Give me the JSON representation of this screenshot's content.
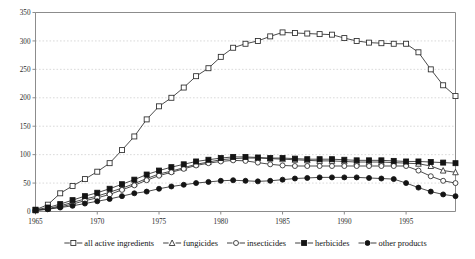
{
  "chart_data": {
    "type": "line",
    "title": "",
    "subtitle": "",
    "xlabel": "",
    "ylabel": "",
    "xlim": [
      1965,
      1999
    ],
    "ylim": [
      0,
      350
    ],
    "yticks": [
      0,
      50,
      100,
      150,
      200,
      250,
      300,
      350
    ],
    "xticks": [
      1965,
      1970,
      1975,
      1980,
      1985,
      1990,
      1995
    ],
    "xticklabels": [
      "1965",
      "1970",
      "1975",
      "1980",
      "1985",
      "1990",
      "1995"
    ],
    "yticklabels": [
      "0",
      "50",
      "100",
      "150",
      "200",
      "250",
      "300",
      "350"
    ],
    "grid": true,
    "grid_axis": "y",
    "legend_position": "bottom-outside",
    "x": [
      1965,
      1966,
      1967,
      1968,
      1969,
      1970,
      1971,
      1972,
      1973,
      1974,
      1975,
      1976,
      1977,
      1978,
      1979,
      1980,
      1981,
      1982,
      1983,
      1984,
      1985,
      1986,
      1987,
      1988,
      1989,
      1990,
      1991,
      1992,
      1993,
      1994,
      1995,
      1996,
      1997,
      1998,
      1999
    ],
    "series": [
      {
        "name": "all active ingredients",
        "marker": "open-square",
        "values": [
          3,
          12,
          32,
          45,
          57,
          70,
          85,
          108,
          132,
          162,
          185,
          200,
          218,
          238,
          252,
          272,
          288,
          295,
          300,
          308,
          315,
          314,
          313,
          312,
          311,
          305,
          300,
          297,
          296,
          295,
          295,
          280,
          250,
          222,
          203
        ]
      },
      {
        "name": "fungicides",
        "marker": "open-triangle",
        "values": [
          2,
          5,
          10,
          16,
          22,
          27,
          34,
          41,
          49,
          58,
          66,
          71,
          77,
          83,
          87,
          91,
          93,
          94,
          94,
          93,
          92,
          91,
          90,
          89,
          89,
          88,
          87,
          87,
          87,
          86,
          85,
          84,
          80,
          72,
          69
        ]
      },
      {
        "name": "insecticides",
        "marker": "open-circle",
        "values": [
          2,
          4,
          8,
          13,
          19,
          24,
          30,
          38,
          46,
          55,
          63,
          69,
          75,
          81,
          85,
          88,
          90,
          89,
          86,
          83,
          81,
          80,
          80,
          80,
          80,
          80,
          80,
          80,
          80,
          80,
          80,
          72,
          62,
          54,
          50
        ]
      },
      {
        "name": "herbicides",
        "marker": "filled-square",
        "values": [
          3,
          7,
          13,
          20,
          27,
          33,
          40,
          48,
          56,
          65,
          72,
          78,
          83,
          88,
          91,
          94,
          96,
          96,
          95,
          94,
          94,
          93,
          92,
          92,
          92,
          91,
          90,
          90,
          90,
          89,
          88,
          88,
          87,
          86,
          85
        ]
      },
      {
        "name": "other products",
        "marker": "filled-circle",
        "values": [
          2,
          4,
          7,
          10,
          14,
          18,
          22,
          27,
          32,
          35,
          40,
          44,
          47,
          50,
          52,
          54,
          55,
          54,
          53,
          54,
          56,
          58,
          59,
          60,
          60,
          60,
          60,
          59,
          58,
          57,
          50,
          42,
          35,
          30,
          27
        ]
      }
    ]
  }
}
